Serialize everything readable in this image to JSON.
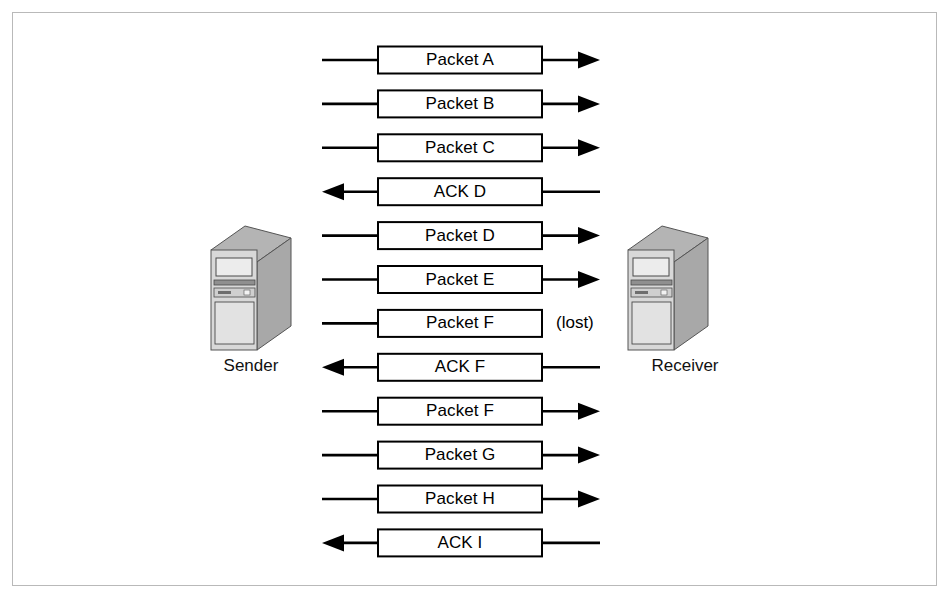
{
  "figure": {
    "background_color": "#ffffff",
    "frame_color": "#b9b9b9",
    "line_color": "#000000",
    "box_fill": "#ffffff",
    "box_stroke": "#000000"
  },
  "nodes": {
    "sender": {
      "label": "Sender",
      "icon": "server-tower-icon"
    },
    "receiver": {
      "label": "Receiver",
      "icon": "server-tower-icon"
    }
  },
  "annotations": {
    "lost": "(lost)"
  },
  "messages": [
    {
      "label": "Packet A",
      "direction": "right",
      "lost": false
    },
    {
      "label": "Packet B",
      "direction": "right",
      "lost": false
    },
    {
      "label": "Packet C",
      "direction": "right",
      "lost": false
    },
    {
      "label": "ACK D",
      "direction": "left",
      "lost": false
    },
    {
      "label": "Packet D",
      "direction": "right",
      "lost": false
    },
    {
      "label": "Packet E",
      "direction": "right",
      "lost": false
    },
    {
      "label": "Packet F",
      "direction": "right",
      "lost": true
    },
    {
      "label": "ACK F",
      "direction": "left",
      "lost": false
    },
    {
      "label": "Packet F",
      "direction": "right",
      "lost": false
    },
    {
      "label": "Packet G",
      "direction": "right",
      "lost": false
    },
    {
      "label": "Packet H",
      "direction": "right",
      "lost": false
    },
    {
      "label": "ACK I",
      "direction": "left",
      "lost": false
    }
  ],
  "geometry": {
    "row_first_center_y": 60,
    "row_pitch": 43.9,
    "box_left": 378,
    "box_right": 542,
    "box_height": 27,
    "left_line_start": 322,
    "right_line_end": 600,
    "sender_icon_x": 205,
    "receiver_icon_x": 622,
    "icon_y": 222
  }
}
